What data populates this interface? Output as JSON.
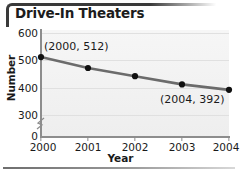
{
  "figure": {
    "title": "Drive-In Theaters",
    "frame_color": "#3a3a3a",
    "rule_color": "#6e6e6e"
  },
  "chart_data": {
    "type": "line",
    "title": "Drive-In Theaters",
    "subtitle": "",
    "xlabel": "Year",
    "ylabel": "Number",
    "categories": [
      "2000",
      "2001",
      "2002",
      "2003",
      "2004"
    ],
    "x": [
      2000,
      2001,
      2002,
      2003,
      2004
    ],
    "values": [
      512,
      472,
      442,
      412,
      392
    ],
    "series": [
      {
        "name": "Drive-In Theaters",
        "values": [
          512,
          472,
          442,
          412,
          392
        ],
        "line_color": "#6b6b6b",
        "marker_color": "#101010"
      }
    ],
    "xlim": [
      2000,
      2004
    ],
    "ylim": [
      300,
      600
    ],
    "y_ticks": [
      600,
      500,
      400,
      300,
      0
    ],
    "y_tick_labels": [
      "600",
      "500",
      "400",
      "300",
      "0"
    ],
    "x_ticks": [
      2000,
      2001,
      2002,
      2003,
      2004
    ],
    "x_tick_labels": [
      "2000",
      "2001",
      "2002",
      "2003",
      "2004"
    ],
    "axis_break": true,
    "axis_break_between": [
      0,
      300
    ],
    "grid": true,
    "grid_axis": "y",
    "legend": false,
    "legend_position": "none",
    "annotations": [
      {
        "label": "(2000, 512)",
        "x": 2000,
        "y": 512
      },
      {
        "label": "(2004, 392)",
        "x": 2004,
        "y": 392
      }
    ]
  },
  "axes": {
    "y_title": "Number",
    "x_title": "Year",
    "y_tick_labels": [
      "600",
      "500",
      "400",
      "300",
      "0"
    ],
    "x_tick_labels": [
      "2000",
      "2001",
      "2002",
      "2003",
      "2004"
    ]
  },
  "annotations": {
    "first": "(2000, 512)",
    "last": "(2004, 392)"
  }
}
